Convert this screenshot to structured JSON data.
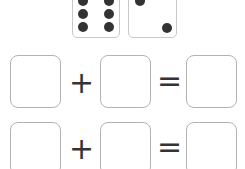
{
  "dice": [
    {
      "value": 6,
      "label": "six"
    },
    {
      "value": 2,
      "label": "two"
    }
  ],
  "equations": [
    {
      "left": "",
      "operator": "+",
      "right": "",
      "equals": "=",
      "result": ""
    },
    {
      "left": "",
      "operator": "+",
      "right": "",
      "equals": "=",
      "result": ""
    }
  ],
  "colors": {
    "dot": "#333333",
    "box_border": "#b3b3b3",
    "die_border": "#c8c8c8"
  }
}
